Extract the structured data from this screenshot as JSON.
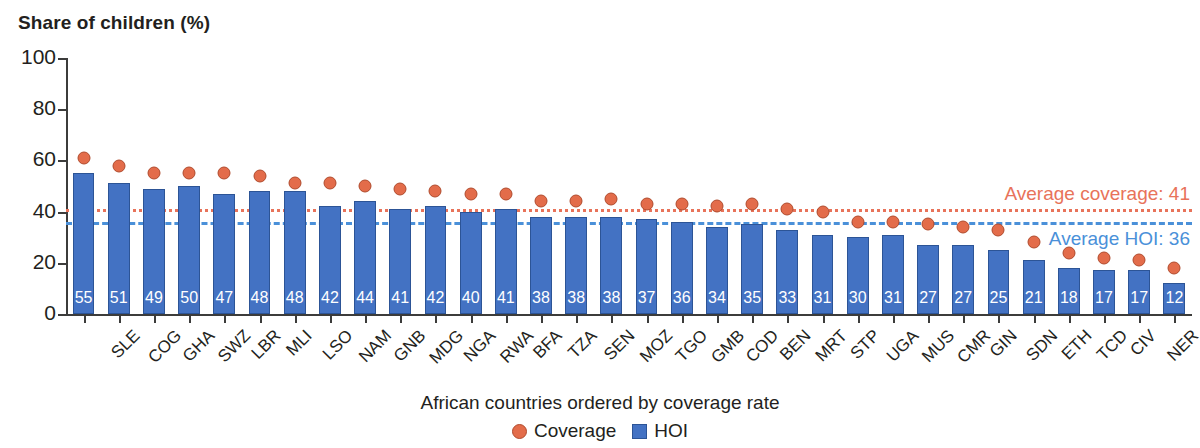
{
  "chart_data": {
    "type": "bar",
    "title": "",
    "ylabel": "Share of children (%)",
    "xlabel": "African countries ordered by coverage rate",
    "ylim": [
      0,
      100
    ],
    "yticks": [
      0,
      20,
      40,
      60,
      80,
      100
    ],
    "grid": false,
    "legend_position": "bottom",
    "categories": [
      "SLE",
      "COG",
      "GHA",
      "SWZ",
      "LBR",
      "MLI",
      "LSO",
      "NAM",
      "GNB",
      "MDG",
      "NGA",
      "RWA",
      "BFA",
      "TZA",
      "SEN",
      "MOZ",
      "TGO",
      "GMB",
      "COD",
      "BEN",
      "MRT",
      "STP",
      "UGA",
      "MUS",
      "CMR",
      "GIN",
      "SDN",
      "ETH",
      "TCD",
      "CIV",
      "NER",
      "AGO"
    ],
    "series": [
      {
        "name": "HOI",
        "type": "bar",
        "color": "#4372c3",
        "values": [
          55,
          51,
          49,
          50,
          47,
          48,
          48,
          42,
          44,
          41,
          42,
          40,
          41,
          38,
          38,
          38,
          37,
          36,
          34,
          35,
          33,
          31,
          30,
          31,
          27,
          27,
          25,
          21,
          18,
          17,
          17,
          12
        ]
      },
      {
        "name": "Coverage",
        "type": "scatter",
        "color": "#e36c4a",
        "values": [
          61,
          58,
          55,
          55,
          55,
          54,
          51,
          51,
          50,
          49,
          48,
          47,
          47,
          44,
          44,
          45,
          43,
          43,
          42,
          43,
          41,
          40,
          36,
          36,
          35,
          34,
          33,
          28,
          24,
          22,
          21,
          18
        ]
      }
    ],
    "annotations": [
      {
        "name": "average-coverage",
        "label": "Average coverage: 41",
        "value": 41,
        "color": "#e8735a",
        "style": "dotted"
      },
      {
        "name": "average-hoi",
        "label": "Average HOI: 36",
        "value": 36,
        "color": "#4a90d9",
        "style": "dashed"
      }
    ],
    "legend": [
      {
        "label": "Coverage",
        "marker": "circle",
        "color": "#e36c4a"
      },
      {
        "label": "HOI",
        "marker": "square",
        "color": "#4372c3"
      }
    ]
  }
}
